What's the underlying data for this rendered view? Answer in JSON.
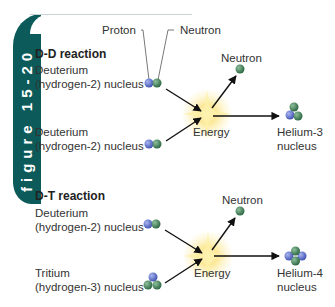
{
  "figure_tab": {
    "label": "figure 15-20"
  },
  "callouts": {
    "proton": "Proton",
    "neutron": "Neutron"
  },
  "dd_reaction": {
    "title": "D-D reaction",
    "reactant1": {
      "line1": "Deuterium",
      "line2": "(hydrogen-2) nucleus"
    },
    "reactant2": {
      "line1": "Deuterium",
      "line2": "(hydrogen-2) nucleus"
    },
    "energy": "Energy",
    "product_neutron": "Neutron",
    "product": {
      "line1": "Helium-3",
      "line2": "nucleus"
    }
  },
  "dt_reaction": {
    "title": "D-T reaction",
    "reactant1": {
      "line1": "Deuterium",
      "line2": "(hydrogen-2) nucleus"
    },
    "reactant2": {
      "line1": "Tritium",
      "line2": "(hydrogen-3) nucleus"
    },
    "energy": "Energy",
    "product_neutron": "Neutron",
    "product": {
      "line1": "Helium-4",
      "line2": "nucleus"
    }
  },
  "colors": {
    "proton": "#5a6fc8",
    "neutron": "#3f7a55",
    "tab": "#0d5a5a",
    "energy": "#f5d35a"
  }
}
